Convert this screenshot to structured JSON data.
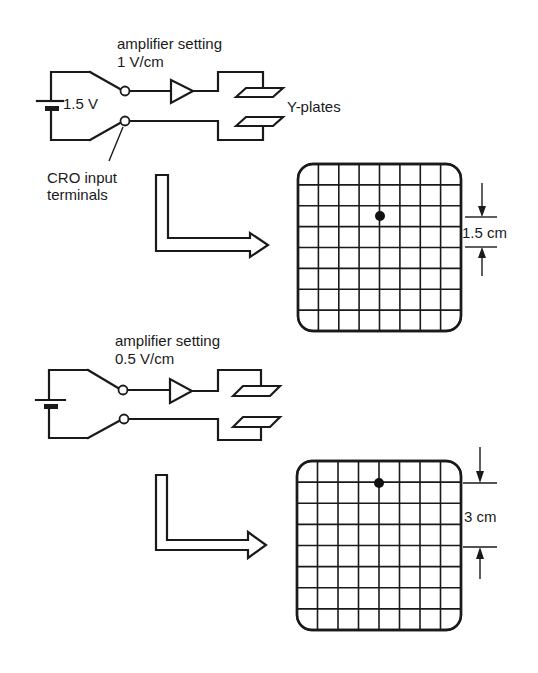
{
  "figure": {
    "panels": [
      {
        "id": "panel-1v",
        "amplifier_label_line1": "amplifier setting",
        "amplifier_label_line2": "1 V/cm",
        "battery_label": "1.5 V",
        "plates_label": "Y-plates",
        "terminals_label_line1": "CRO input",
        "terminals_label_line2": "terminals",
        "screen": {
          "grid_cols": 8,
          "grid_rows": 8,
          "dot_col": 4,
          "dot_row": 2.5,
          "deflection_label": "1.5 cm"
        }
      },
      {
        "id": "panel-05v",
        "amplifier_label_line1": "amplifier setting",
        "amplifier_label_line2": "0.5 V/cm",
        "screen": {
          "grid_cols": 8,
          "grid_rows": 8,
          "dot_col": 4,
          "dot_row": 1,
          "deflection_label": "3 cm"
        }
      }
    ],
    "colors": {
      "ink": "#1a1a1a",
      "paper": "#ffffff"
    }
  }
}
